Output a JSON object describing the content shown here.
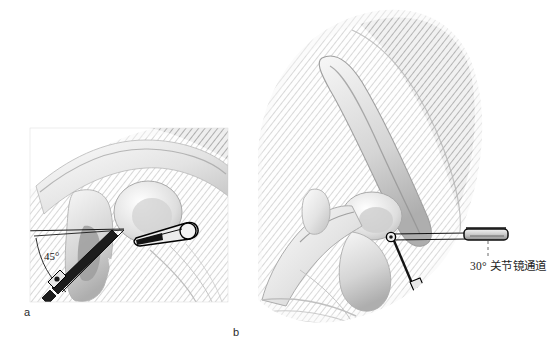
{
  "figure": {
    "background_color": "#ffffff",
    "width": 560,
    "height": 359,
    "kind": "medical-illustration"
  },
  "panels": [
    {
      "id": "a",
      "label": "a",
      "label_position": {
        "x": 24,
        "y": 306
      },
      "frame": {
        "x": 30,
        "y": 128,
        "width": 198,
        "height": 174
      },
      "description": "close-up oblique view of glenohumeral joint with drill guide at 45 degrees and cannula",
      "annotations": [
        {
          "name": "angle-label",
          "text": "45°",
          "position": {
            "x": 44,
            "y": 250
          }
        }
      ],
      "instruments": [
        {
          "name": "cannula-trocar",
          "orientation": "oblique-upper-right"
        },
        {
          "name": "drill-guide",
          "orientation": "oblique-lower-left"
        },
        {
          "name": "guide-pin",
          "orientation": "diagonal"
        }
      ],
      "reference_lines": [
        {
          "name": "horizontal-reference-line"
        },
        {
          "name": "angle-arc"
        },
        {
          "name": "guide-axis-line"
        }
      ]
    },
    {
      "id": "b",
      "label": "b",
      "label_position": {
        "x": 233,
        "y": 326
      },
      "description": "wide lateral view of shoulder with 30 degree arthroscope portal entering joint",
      "annotations": [
        {
          "name": "portal-callout",
          "text": "30° 关节镜通道",
          "position": {
            "x": 470,
            "y": 257
          },
          "leader": {
            "type": "dashed-vertical",
            "x": 488,
            "y1": 238,
            "y2": 256
          }
        }
      ],
      "instruments": [
        {
          "name": "arthroscope-cannula",
          "orientation": "horizontal"
        },
        {
          "name": "guide-pin",
          "orientation": "diagonal-down"
        },
        {
          "name": "drill-guide-tip",
          "orientation": "diagonal-down"
        }
      ]
    }
  ],
  "colors": {
    "background": "#ffffff",
    "bone_light": "#f2f2f2",
    "bone_mid": "#d8d8d8",
    "bone_shadow": "#b4b4b4",
    "tissue_dark": "#9a9a9a",
    "outline": "#1a1a1a",
    "instrument_fill": "#e8e8e8",
    "instrument_dark": "#141414",
    "text": "#1f1f1f"
  }
}
